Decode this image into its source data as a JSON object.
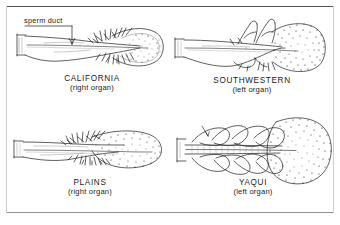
{
  "figure": {
    "background_color": "#ffffff",
    "ink_color": "#1b1b1b",
    "frame_color": "#555555",
    "annotation": {
      "label": "sperm duct",
      "icon": "leader-arrow-icon"
    }
  },
  "panels": [
    {
      "id": "california",
      "name": "CALIFORNIA",
      "side": "(right organ)",
      "icon": "organ-diagram-icon",
      "head_style": "spiny-tufted",
      "position": {
        "x": 14,
        "y": 12,
        "w": 156,
        "h": 98
      }
    },
    {
      "id": "southwestern",
      "name": "SOUTHWESTERN",
      "side": "(left organ)",
      "icon": "organ-diagram-icon",
      "head_style": "stippled-hooked",
      "position": {
        "x": 172,
        "y": 12,
        "w": 160,
        "h": 98
      }
    },
    {
      "id": "plains",
      "name": "PLAINS",
      "side": "(right organ)",
      "icon": "organ-diagram-icon",
      "head_style": "elongate-speckled",
      "position": {
        "x": 10,
        "y": 118,
        "w": 160,
        "h": 94
      }
    },
    {
      "id": "yaqui",
      "name": "YAQUI",
      "side": "(left organ)",
      "icon": "organ-diagram-icon",
      "head_style": "broad-stippled-lobed",
      "position": {
        "x": 172,
        "y": 112,
        "w": 162,
        "h": 100
      }
    }
  ]
}
